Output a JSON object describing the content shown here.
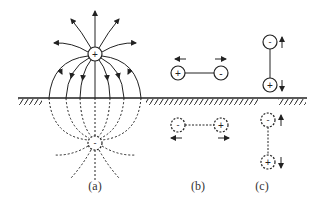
{
  "diagram": {
    "colors": {
      "stroke": "#222222",
      "background": "#ffffff"
    },
    "labels": {
      "a": "(a)",
      "b": "(b)",
      "c": "(c)"
    },
    "charges": {
      "a_real": "+",
      "a_image": "-",
      "b_real_left": "+",
      "b_real_right": "-",
      "b_image_left": "-",
      "b_image_right": "+",
      "c_real_top": "-",
      "c_real_bottom": "+",
      "c_image_top": "-",
      "c_image_bottom": "+"
    },
    "panels": [
      {
        "id": "a",
        "description": "Point charge above ground plane with field lines and dashed image charge below"
      },
      {
        "id": "b",
        "description": "Horizontal dipole above ground with reversed dashed image dipole"
      },
      {
        "id": "c",
        "description": "Vertical dipole above ground with same-orientation dashed image dipole"
      }
    ]
  }
}
